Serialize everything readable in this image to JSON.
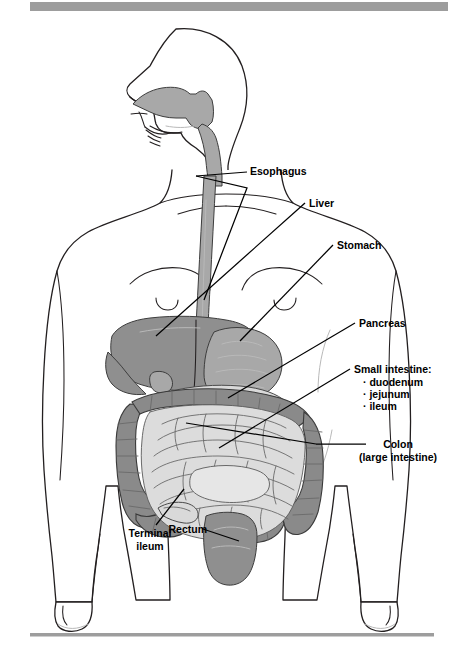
{
  "figure": {
    "background_color": "#ffffff",
    "rules": {
      "top_bar_color": "#9d9d9d",
      "bottom_rule_color": "#9d9d9d"
    }
  },
  "labels": {
    "esophagus": "Esophagus",
    "liver": "Liver",
    "stomach": "Stomach",
    "pancreas": "Pancreas",
    "small_intestine_heading": "Small intestine:",
    "small_intestine_items": [
      "· duodenum",
      "· jejunum",
      "· ileum"
    ],
    "colon_line1": "Colon",
    "colon_line2": "(large intestine)",
    "terminal_ileum_line1": "Terminal",
    "terminal_ileum_line2": "ileum",
    "rectum": "Rectum"
  },
  "organ_colors": {
    "liver": "#8f8f8f",
    "stomach": "#a8a8a8",
    "pancreas": "#d9d9d9",
    "colon": "#8a8a8a",
    "small_intestine": "#dcdcdc",
    "rectum": "#8f8f8f",
    "esophagus": "#a8a8a8",
    "pharynx": "#a8a8a8",
    "outline": "#231f20"
  }
}
